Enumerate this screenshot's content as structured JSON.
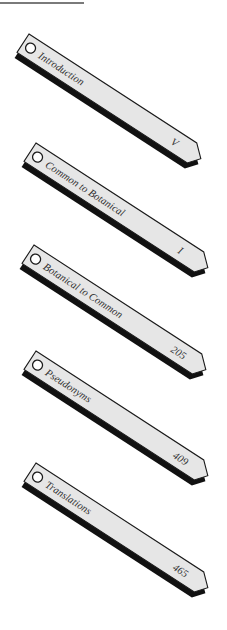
{
  "section_tabs": [
    {
      "label": "Introduction",
      "page": "V"
    },
    {
      "label": "Common to Botanical",
      "page": "I"
    },
    {
      "label": "Botanical to Common",
      "page": "205"
    },
    {
      "label": "Pseudonyms",
      "page": "409"
    },
    {
      "label": "Translations",
      "page": "465"
    }
  ],
  "colors": {
    "tab_fill": "#e6e6e6",
    "tab_outline": "#1a1a1a",
    "tab_shadow": "#111111",
    "text": "#333333",
    "rule": "#7a7a7a"
  }
}
